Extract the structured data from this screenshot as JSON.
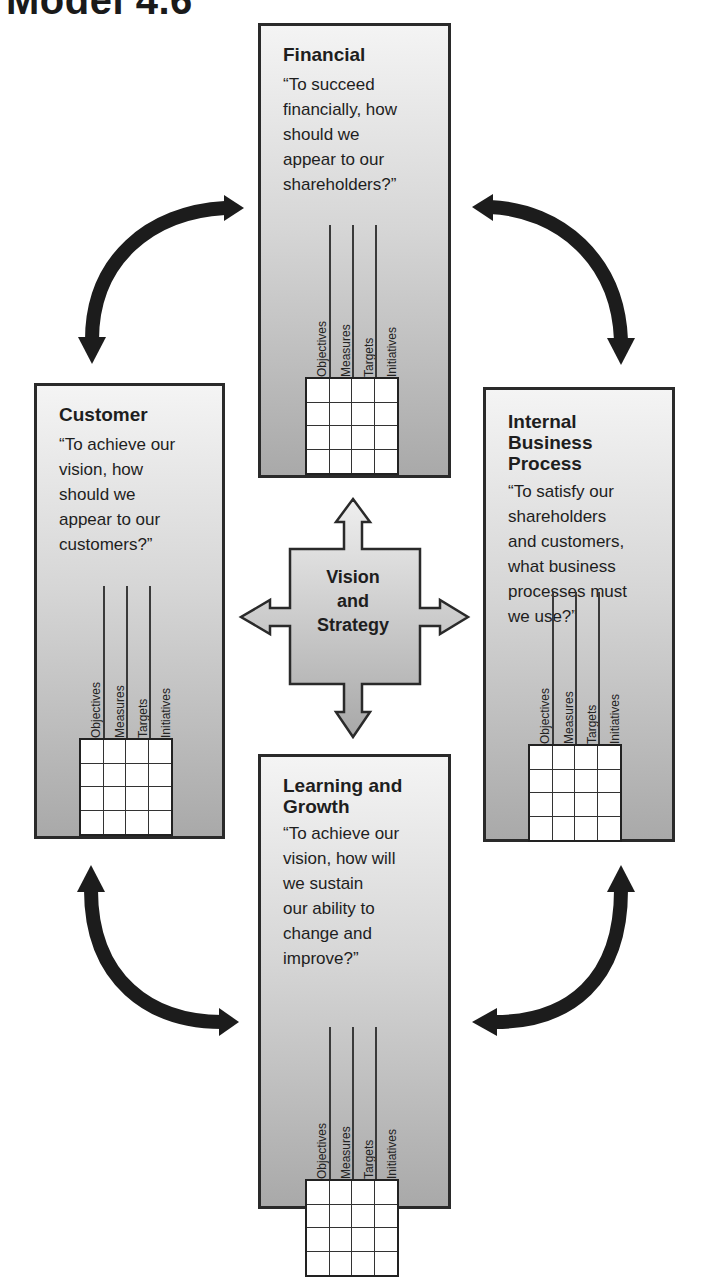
{
  "heading": "Model 4.6",
  "center": {
    "lines": [
      "Vision",
      "and",
      "Strategy"
    ]
  },
  "panels": {
    "financial": {
      "title_lines": [
        "Financial"
      ],
      "question_lines": [
        "“To succeed",
        "financially, how",
        "should we",
        "appear to our",
        "shareholders?”"
      ]
    },
    "customer": {
      "title_lines": [
        "Customer"
      ],
      "question_lines": [
        "“To achieve our",
        "vision, how",
        "should we",
        "appear to our",
        "customers?”"
      ]
    },
    "internal": {
      "title_lines": [
        "Internal",
        "Business",
        "Process"
      ],
      "question_lines": [
        "“To satisfy our",
        "shareholders",
        "and customers,",
        "what business",
        "processes must",
        "we use?”"
      ]
    },
    "learning": {
      "title_lines": [
        "Learning and",
        "Growth"
      ],
      "question_lines": [
        "“To achieve our",
        "vision, how will",
        "we sustain",
        "our ability to",
        "change and",
        "improve?”"
      ]
    }
  },
  "scorecard_columns": [
    "Objectives",
    "Measures",
    "Targets",
    "Initiatives"
  ],
  "colors": {
    "border": "#2a2a2a",
    "arrow": "#1c1c1c",
    "panel_top": "#f4f4f4",
    "panel_bottom": "#a9a9a9"
  }
}
